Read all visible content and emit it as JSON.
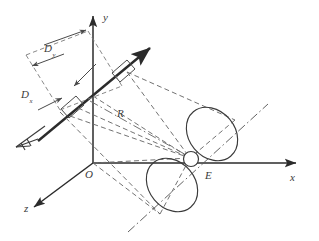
{
  "figure": {
    "type": "diagram",
    "background_color": "#ffffff",
    "line_color": "#3a3a3a",
    "axis_color": "#2b2b2b"
  },
  "axes": {
    "x": {
      "label": "x",
      "label_sub": ""
    },
    "y": {
      "label": "y",
      "label_sub": ""
    },
    "z": {
      "label": "z",
      "label_sub": ""
    }
  },
  "points": {
    "origin": {
      "label": "O"
    },
    "target": {
      "label": "E"
    }
  },
  "dimensions": {
    "vertical": {
      "label": "D",
      "sub": "y"
    },
    "horizontal": {
      "label": "D",
      "sub": "x"
    }
  },
  "range": {
    "label": "R"
  },
  "elements": {
    "aperture_upper": "aperture-rectangle-upper",
    "aperture_lower": "aperture-rectangle-lower",
    "beam_arrow": "beam-direction-arrow",
    "fletched_arrow": "fletched-arrow-tail",
    "lobe_upper": "radiation-lobe-upper",
    "lobe_lower": "radiation-lobe-lower",
    "target_circle": "target-marker-circle",
    "pattern_axis": "radiation-pattern-axis"
  }
}
